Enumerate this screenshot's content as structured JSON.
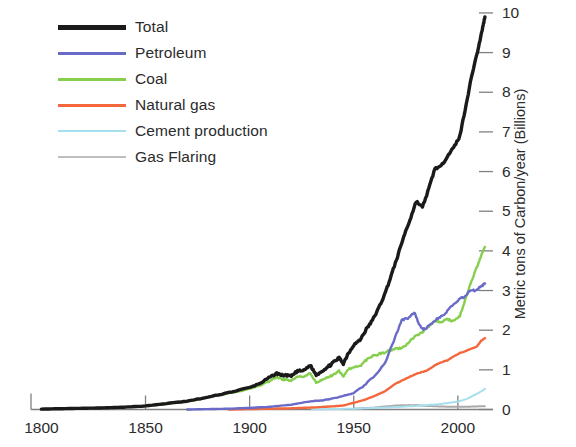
{
  "chart_data": {
    "type": "line",
    "title": "",
    "xlabel": "",
    "ylabel": "Metric tons of Carbon/year (Billions)",
    "xlim": [
      1795,
      2014
    ],
    "ylim": [
      0,
      10.2
    ],
    "grid": false,
    "legend_position": "top-left",
    "xticks": [
      1800,
      1850,
      1900,
      1950,
      2000
    ],
    "xtick_labels": [
      "1800",
      "1850",
      "1900",
      "1950",
      "2000"
    ],
    "yticks": [
      0,
      1,
      2,
      3,
      4,
      5,
      6,
      7,
      8,
      9,
      10
    ],
    "ytick_labels": [
      "0",
      "1",
      "2",
      "3",
      "4",
      "5",
      "6",
      "7",
      "8",
      "9",
      "10"
    ],
    "yaxis_side": "right",
    "series": [
      {
        "name": "Total",
        "color": "#1a1a1a",
        "width": 3.4,
        "x": [
          1800,
          1810,
          1820,
          1830,
          1840,
          1850,
          1860,
          1870,
          1880,
          1890,
          1900,
          1905,
          1910,
          1913,
          1916,
          1918,
          1920,
          1923,
          1926,
          1929,
          1932,
          1935,
          1938,
          1940,
          1943,
          1945,
          1947,
          1950,
          1953,
          1956,
          1959,
          1962,
          1965,
          1968,
          1971,
          1974,
          1977,
          1980,
          1983,
          1986,
          1989,
          1992,
          1995,
          1998,
          2001,
          2004,
          2007,
          2010,
          2012,
          2013
        ],
        "y": [
          0.01,
          0.02,
          0.03,
          0.04,
          0.06,
          0.09,
          0.15,
          0.21,
          0.31,
          0.43,
          0.55,
          0.66,
          0.82,
          0.91,
          0.86,
          0.86,
          0.84,
          0.97,
          0.98,
          1.12,
          0.87,
          0.98,
          1.09,
          1.18,
          1.3,
          1.16,
          1.38,
          1.63,
          1.75,
          2.02,
          2.25,
          2.56,
          2.92,
          3.38,
          3.85,
          4.36,
          4.78,
          5.25,
          5.1,
          5.56,
          6.08,
          6.13,
          6.4,
          6.6,
          6.9,
          7.7,
          8.5,
          9.15,
          9.65,
          9.9
        ]
      },
      {
        "name": "Petroleum",
        "color": "#6a6ac8",
        "width": 2.4,
        "x": [
          1870,
          1880,
          1890,
          1900,
          1910,
          1920,
          1925,
          1930,
          1935,
          1940,
          1945,
          1950,
          1955,
          1960,
          1965,
          1970,
          1973,
          1976,
          1979,
          1981,
          1983,
          1985,
          1988,
          1991,
          1994,
          1997,
          2000,
          2003,
          2006,
          2009,
          2011,
          2013
        ],
        "y": [
          0.0,
          0.01,
          0.02,
          0.04,
          0.07,
          0.12,
          0.17,
          0.21,
          0.23,
          0.28,
          0.34,
          0.42,
          0.6,
          0.85,
          1.15,
          1.84,
          2.25,
          2.3,
          2.45,
          2.2,
          2.03,
          2.05,
          2.2,
          2.32,
          2.42,
          2.6,
          2.75,
          2.85,
          3.0,
          3.0,
          3.1,
          3.18
        ]
      },
      {
        "name": "Coal",
        "color": "#86cf4e",
        "width": 2.4,
        "x": [
          1800,
          1820,
          1840,
          1850,
          1860,
          1870,
          1880,
          1890,
          1900,
          1905,
          1910,
          1913,
          1916,
          1918,
          1920,
          1923,
          1926,
          1929,
          1932,
          1935,
          1938,
          1940,
          1943,
          1945,
          1947,
          1950,
          1953,
          1956,
          1959,
          1962,
          1965,
          1968,
          1971,
          1974,
          1977,
          1980,
          1983,
          1986,
          1989,
          1992,
          1995,
          1998,
          2001,
          2004,
          2007,
          2010,
          2012,
          2013
        ],
        "y": [
          0.01,
          0.03,
          0.06,
          0.09,
          0.14,
          0.2,
          0.3,
          0.41,
          0.52,
          0.6,
          0.73,
          0.82,
          0.76,
          0.75,
          0.72,
          0.83,
          0.81,
          0.91,
          0.67,
          0.76,
          0.82,
          0.87,
          0.97,
          0.83,
          1.0,
          1.07,
          1.1,
          1.25,
          1.35,
          1.4,
          1.44,
          1.5,
          1.53,
          1.58,
          1.72,
          1.87,
          1.95,
          2.1,
          2.25,
          2.2,
          2.28,
          2.22,
          2.35,
          2.85,
          3.3,
          3.7,
          4.0,
          4.1
        ]
      },
      {
        "name": "Natural gas",
        "color": "#f4673c",
        "width": 2.4,
        "x": [
          1890,
          1900,
          1910,
          1920,
          1930,
          1940,
          1945,
          1950,
          1955,
          1960,
          1965,
          1970,
          1975,
          1980,
          1985,
          1990,
          1995,
          2000,
          2005,
          2009,
          2011,
          2013
        ],
        "y": [
          0.0,
          0.01,
          0.02,
          0.03,
          0.05,
          0.08,
          0.1,
          0.17,
          0.24,
          0.34,
          0.46,
          0.65,
          0.78,
          0.9,
          0.98,
          1.15,
          1.24,
          1.4,
          1.5,
          1.58,
          1.72,
          1.8
        ]
      },
      {
        "name": "Cement production",
        "color": "#a6dfee",
        "width": 2.0,
        "x": [
          1930,
          1950,
          1960,
          1970,
          1980,
          1990,
          1995,
          2000,
          2004,
          2007,
          2010,
          2012,
          2013
        ],
        "y": [
          0.0,
          0.02,
          0.04,
          0.06,
          0.09,
          0.13,
          0.16,
          0.2,
          0.26,
          0.34,
          0.42,
          0.48,
          0.52
        ]
      },
      {
        "name": "Gas Flaring",
        "color": "#aaaaaa",
        "width": 2.0,
        "x": [
          1950,
          1960,
          1970,
          1975,
          1980,
          1985,
          1990,
          1995,
          2000,
          2005,
          2010,
          2013
        ],
        "y": [
          0.02,
          0.05,
          0.1,
          0.11,
          0.11,
          0.09,
          0.08,
          0.07,
          0.07,
          0.07,
          0.08,
          0.08
        ]
      }
    ]
  },
  "legend": {
    "items": [
      {
        "label": "Total",
        "color": "#1a1a1a",
        "thickness": "5px"
      },
      {
        "label": "Petroleum",
        "color": "#6a6ac8",
        "thickness": "3px"
      },
      {
        "label": "Coal",
        "color": "#86cf4e",
        "thickness": "3px"
      },
      {
        "label": "Natural gas",
        "color": "#f4673c",
        "thickness": "3px"
      },
      {
        "label": "Cement production",
        "color": "#a6dfee",
        "thickness": "2.5px"
      },
      {
        "label": "Gas Flaring",
        "color": "#bfbfbf",
        "thickness": "2px"
      }
    ]
  },
  "axes": {
    "ylabel": "Metric tons of Carbon/year (Billions)",
    "axis_color": "#808080"
  }
}
